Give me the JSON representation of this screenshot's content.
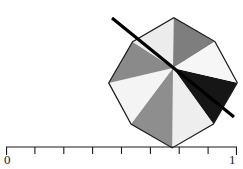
{
  "figure": {
    "title": "",
    "background_color": "#ffffff"
  },
  "polygon": {
    "name": "octagon",
    "sides": 8,
    "center": {
      "x": 173,
      "y": 68
    },
    "radius": 66,
    "rotation_deg": 13,
    "outline_color": "#1a1a1a",
    "outline_width": 1.2,
    "vertices": [
      {
        "x": 237.3,
        "y": 82.8
      },
      {
        "x": 213.4,
        "y": 124.0
      },
      {
        "x": 172.2,
        "y": 147.9
      },
      {
        "x": 131.0,
        "y": 124.1
      },
      {
        "x": 108.7,
        "y": 82.9
      },
      {
        "x": 132.6,
        "y": 41.7
      },
      {
        "x": 173.8,
        "y": 17.8
      },
      {
        "x": 215.0,
        "y": 41.6
      }
    ]
  },
  "sectors": {
    "count": 8,
    "fill_colors": [
      "#161616",
      "#eeeeee",
      "#8e8e8e",
      "#f4f4f4",
      "#8a8a8a",
      "#ececec",
      "#7e7e7e",
      "#f6f6f6"
    ],
    "color_names": [
      "black",
      "light-gray",
      "medium-gray",
      "near-white",
      "medium-gray",
      "light-gray",
      "medium-gray",
      "near-white"
    ]
  },
  "diagonal_line": {
    "name": "axis-of-symmetry",
    "color": "#000000",
    "width": 3.2,
    "start": {
      "x": 112,
      "y": 18
    },
    "end": {
      "x": 234,
      "y": 117
    }
  },
  "scale_bar": {
    "color": "#1a1a1a",
    "line_width": 1.1,
    "baseline_y": 147,
    "tick_length": 7,
    "left_x": 6,
    "right_x": 237,
    "tick_count": 9,
    "labels": {
      "min": "0",
      "max": "1"
    },
    "tick_positions": [
      6,
      34.9,
      63.8,
      92.6,
      121.5,
      150.4,
      179.2,
      208.1,
      237
    ]
  }
}
